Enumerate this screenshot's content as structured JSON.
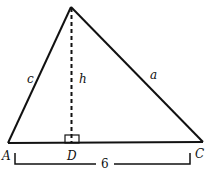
{
  "figure": {
    "type": "triangle-with-altitude",
    "vertices": {
      "A": {
        "label": "A"
      },
      "B": {
        "label": ""
      },
      "C": {
        "label": "C"
      },
      "D": {
        "label": "D"
      }
    },
    "sides": {
      "c": {
        "label": "c"
      },
      "a": {
        "label": "a"
      },
      "h": {
        "label": "h"
      }
    },
    "base_length": {
      "label": "6"
    },
    "colors": {
      "stroke": "#111111",
      "background": "#ffffff"
    }
  }
}
